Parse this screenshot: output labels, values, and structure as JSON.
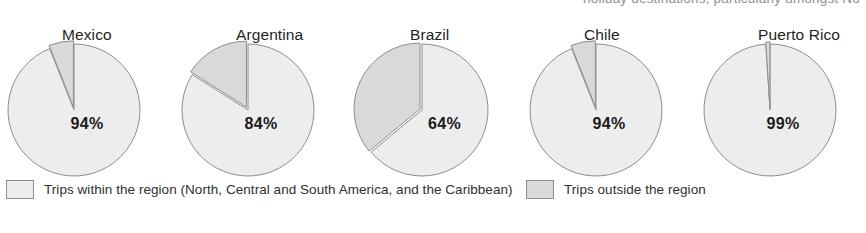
{
  "clipped_header_text": "holiday  destinations,  particularly  amongst  No",
  "chart_data": {
    "type": "pie",
    "title": "",
    "subtitle": "",
    "xlabel": "",
    "ylabel": "",
    "grid": false,
    "legend_position": "bottom",
    "categories": [
      "Trips within the region",
      "Trips outside the region"
    ],
    "colors": {
      "inside_region": "#ededed",
      "outside_region": "#d9d9d9",
      "outline": "#8d8d8d",
      "text": "#1a1a1a"
    },
    "charts": [
      {
        "name": "Mexico",
        "label": "Mexico",
        "value_label": "94%",
        "series": [
          {
            "name": "Trips within the region",
            "value": 94
          },
          {
            "name": "Trips outside the region",
            "value": 6
          }
        ]
      },
      {
        "name": "Argentina",
        "label": "Argentina",
        "value_label": "84%",
        "series": [
          {
            "name": "Trips within the region",
            "value": 84
          },
          {
            "name": "Trips outside the region",
            "value": 16
          }
        ]
      },
      {
        "name": "Brazil",
        "label": "Brazil",
        "value_label": "64%",
        "series": [
          {
            "name": "Trips within the region",
            "value": 64
          },
          {
            "name": "Trips outside the region",
            "value": 36
          }
        ]
      },
      {
        "name": "Chile",
        "label": "Chile",
        "value_label": "94%",
        "series": [
          {
            "name": "Trips within the region",
            "value": 94
          },
          {
            "name": "Trips outside the region",
            "value": 6
          }
        ]
      },
      {
        "name": "Puerto Rico",
        "label": "Puerto Rico",
        "value_label": "99%",
        "series": [
          {
            "name": "Trips within the region",
            "value": 99
          },
          {
            "name": "Trips outside the region",
            "value": 1
          }
        ]
      }
    ]
  },
  "legend": {
    "items": [
      {
        "key": "inside-region",
        "label": "Trips within the region (North, Central and South America, and the Caribbean)",
        "color": "#ededed"
      },
      {
        "key": "outside-region",
        "label": "Trips outside the region",
        "color": "#d9d9d9"
      }
    ]
  }
}
